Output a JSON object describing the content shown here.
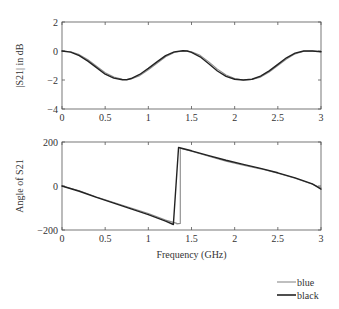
{
  "chart_data": [
    {
      "type": "line",
      "title": "",
      "xlabel": "",
      "ylabel": "|S21| in dB",
      "xlim": [
        0,
        3
      ],
      "ylim": [
        -4,
        2
      ],
      "xticks": [
        0,
        0.5,
        1,
        1.5,
        2,
        2.5,
        3
      ],
      "xtick_labels": [
        "0",
        "0.5",
        "1",
        "1.5",
        "2",
        "2.5",
        "3"
      ],
      "yticks": [
        -4,
        -2,
        0,
        2
      ],
      "ytick_labels": [
        "−4",
        "−2",
        "0",
        "2"
      ],
      "grid": false,
      "series": [
        {
          "name": "blue",
          "color": "#8a8a8a",
          "x": [
            0,
            0.1,
            0.2,
            0.3,
            0.4,
            0.5,
            0.6,
            0.7,
            0.75,
            0.8,
            0.9,
            1.0,
            1.1,
            1.2,
            1.3,
            1.4,
            1.45,
            1.5,
            1.6,
            1.7,
            1.8,
            1.9,
            2.0,
            2.1,
            2.2,
            2.3,
            2.4,
            2.5,
            2.6,
            2.7,
            2.8,
            2.9,
            3.0
          ],
          "y": [
            0,
            -0.05,
            -0.25,
            -0.6,
            -1.05,
            -1.5,
            -1.8,
            -1.95,
            -1.97,
            -1.93,
            -1.7,
            -1.3,
            -0.85,
            -0.4,
            -0.1,
            0.0,
            0.0,
            -0.05,
            -0.3,
            -0.75,
            -1.25,
            -1.65,
            -1.9,
            -2.0,
            -1.97,
            -1.8,
            -1.45,
            -1.0,
            -0.55,
            -0.2,
            -0.02,
            0.0,
            -0.05
          ]
        },
        {
          "name": "black",
          "color": "#222222",
          "x": [
            0,
            0.1,
            0.2,
            0.3,
            0.4,
            0.5,
            0.6,
            0.7,
            0.75,
            0.8,
            0.9,
            1.0,
            1.1,
            1.2,
            1.3,
            1.4,
            1.45,
            1.5,
            1.6,
            1.7,
            1.8,
            1.9,
            2.0,
            2.1,
            2.2,
            2.3,
            2.4,
            2.5,
            2.6,
            2.7,
            2.8,
            2.9,
            3.0
          ],
          "y": [
            0,
            -0.08,
            -0.32,
            -0.7,
            -1.15,
            -1.6,
            -1.87,
            -1.98,
            -1.98,
            -1.9,
            -1.62,
            -1.2,
            -0.75,
            -0.32,
            -0.06,
            0.02,
            0.0,
            -0.1,
            -0.4,
            -0.88,
            -1.38,
            -1.75,
            -1.95,
            -2.0,
            -1.95,
            -1.73,
            -1.37,
            -0.92,
            -0.47,
            -0.15,
            0.0,
            0.0,
            -0.05
          ]
        }
      ]
    },
    {
      "type": "line",
      "title": "",
      "xlabel": "Frequency (GHz)",
      "ylabel": "Angle of S21",
      "xlim": [
        0,
        3
      ],
      "ylim": [
        -200,
        200
      ],
      "xticks": [
        0,
        0.5,
        1,
        1.5,
        2,
        2.5,
        3
      ],
      "xtick_labels": [
        "0",
        "0.5",
        "1",
        "1.5",
        "2",
        "2.5",
        "3"
      ],
      "yticks": [
        -200,
        0,
        200
      ],
      "ytick_labels": [
        "−200",
        "0",
        "200"
      ],
      "grid": false,
      "series": [
        {
          "name": "blue",
          "color": "#8a8a8a",
          "x": [
            0,
            0.2,
            0.4,
            0.6,
            0.8,
            1.0,
            1.2,
            1.33,
            1.33,
            1.37,
            1.37,
            1.5,
            1.7,
            1.9,
            2.1,
            2.3,
            2.5,
            2.7,
            2.9,
            3.0
          ],
          "y": [
            0,
            -22,
            -50,
            -75,
            -100,
            -125,
            -155,
            -170,
            -172,
            -170,
            172,
            158,
            135,
            113,
            95,
            78,
            58,
            35,
            8,
            -8
          ],
          "legend": "blue"
        },
        {
          "name": "black",
          "color": "#222222",
          "x": [
            0,
            0.2,
            0.4,
            0.6,
            0.8,
            1.0,
            1.2,
            1.29,
            1.29,
            1.35,
            1.5,
            1.7,
            1.9,
            2.1,
            2.3,
            2.5,
            2.7,
            2.9,
            3.0
          ],
          "y": [
            0,
            -24,
            -52,
            -78,
            -104,
            -130,
            -160,
            -175,
            -175,
            175,
            160,
            138,
            117,
            98,
            80,
            60,
            37,
            10,
            -14
          ],
          "legend": "black"
        }
      ]
    }
  ],
  "legend": {
    "placement": "bottom-right",
    "entries": [
      {
        "label": "blue",
        "color": "#8a8a8a"
      },
      {
        "label": "black",
        "color": "#222222"
      }
    ]
  }
}
